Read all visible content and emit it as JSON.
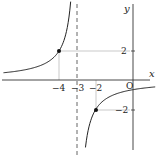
{
  "chart_data": {
    "type": "line",
    "title": "",
    "xlabel": "x",
    "ylabel": "y",
    "function": "y = -2/(x+3)",
    "asymptote": {
      "vertical": -3,
      "horizontal": 0
    },
    "xlim": [
      -7,
      1.2
    ],
    "ylim": [
      -5.2,
      5.5
    ],
    "x_ticks": [
      {
        "value": -4,
        "label": "−4"
      },
      {
        "value": -3,
        "label": "−3"
      },
      {
        "value": -2,
        "label": "−2"
      }
    ],
    "y_ticks": [
      {
        "value": 2,
        "label": "2"
      },
      {
        "value": -2,
        "label": "−2"
      }
    ],
    "origin_label": "O",
    "points": [
      {
        "x": -4,
        "y": 2
      },
      {
        "x": -2,
        "y": -2
      }
    ],
    "series": [
      {
        "name": "left-branch",
        "x_range": [
          -7,
          -3.37
        ]
      },
      {
        "name": "right-branch",
        "x_range": [
          -2.57,
          1.2
        ]
      }
    ],
    "grid": false,
    "legend": null
  },
  "labels": {
    "x_axis": "x",
    "y_axis": "y",
    "origin": "O",
    "tick_m4": "−4",
    "tick_m3": "−3",
    "tick_m2": "−2",
    "tick_y2": "2",
    "tick_ym2": "−2"
  },
  "colors": {
    "curve": "#222222",
    "axis": "#333333",
    "guide": "#bbbbbb",
    "asymptote": "#555555"
  }
}
